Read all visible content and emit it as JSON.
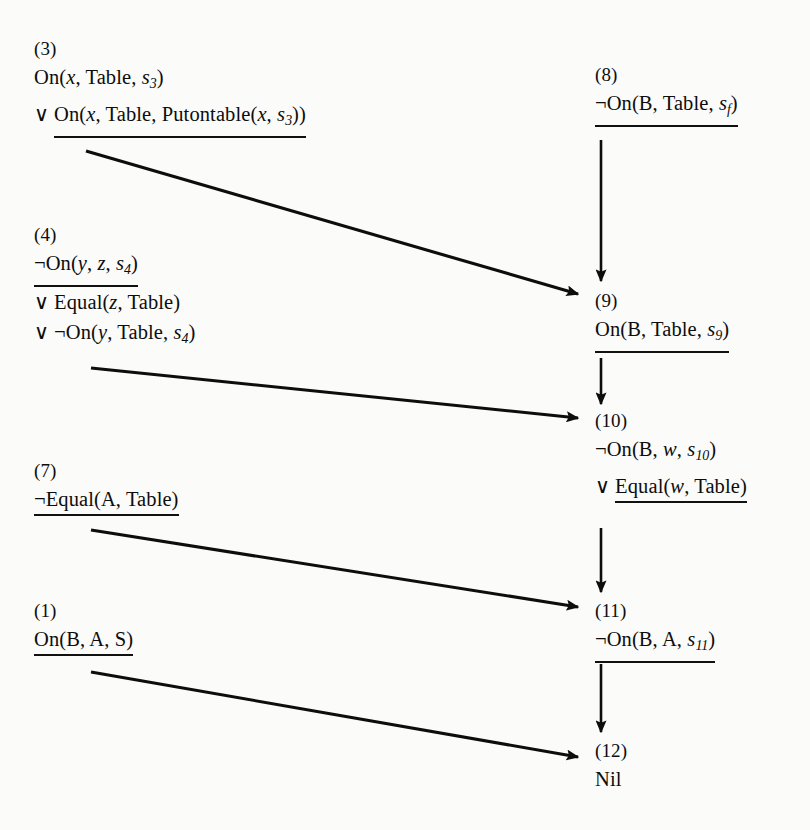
{
  "figure": {
    "type": "resolution-refutation-diagram",
    "ink_color": "#0d0d0d",
    "paper_color": "#fbfbf9"
  },
  "clauses": {
    "c3": {
      "tag": "(3)",
      "lines": [
        {
          "op": "",
          "text": "On(x, Table, s3)",
          "underlined": false
        },
        {
          "op": "∨",
          "text": "On(x, Table, Putontable(x, s3))",
          "underlined": true
        }
      ]
    },
    "c4": {
      "tag": "(4)",
      "lines": [
        {
          "op": "",
          "text": "¬On(y, z, s4)",
          "underlined": true
        },
        {
          "op": "∨",
          "text": "Equal(z, Table)",
          "underlined": false
        },
        {
          "op": "∨",
          "text": "¬On(y, Table, s4)",
          "underlined": false
        }
      ]
    },
    "c7": {
      "tag": "(7)",
      "lines": [
        {
          "op": "",
          "text": "¬Equal(A, Table)",
          "underlined": true
        }
      ]
    },
    "c1": {
      "tag": "(1)",
      "lines": [
        {
          "op": "",
          "text": "On(B, A, S)",
          "underlined": true
        }
      ]
    },
    "c8": {
      "tag": "(8)",
      "lines": [
        {
          "op": "",
          "text": "¬On(B, Table, sf)",
          "underlined": true
        }
      ]
    },
    "c9": {
      "tag": "(9)",
      "lines": [
        {
          "op": "",
          "text": "On(B, Table, s9)",
          "underlined": true
        }
      ]
    },
    "c10": {
      "tag": "(10)",
      "lines": [
        {
          "op": "",
          "text": "¬On(B, w, s10)",
          "underlined": false
        },
        {
          "op": "∨",
          "text": "Equal(w, Table)",
          "underlined": true
        }
      ]
    },
    "c11": {
      "tag": "(11)",
      "lines": [
        {
          "op": "",
          "text": "¬On(B, A, s11)",
          "underlined": true
        }
      ]
    },
    "c12": {
      "tag": "(12)",
      "lines": [
        {
          "op": "",
          "text": "Nil",
          "underlined": false
        }
      ]
    }
  },
  "edges": [
    {
      "name": "edge-8-to-9",
      "from": "c8",
      "to": "c9",
      "kind": "vertical"
    },
    {
      "name": "edge-3-to-9",
      "from": "c3",
      "to": "c9",
      "kind": "diagonal"
    },
    {
      "name": "edge-9-to-10",
      "from": "c9",
      "to": "c10",
      "kind": "vertical"
    },
    {
      "name": "edge-4-to-10",
      "from": "c4",
      "to": "c10",
      "kind": "diagonal"
    },
    {
      "name": "edge-10-to-11",
      "from": "c10",
      "to": "c11",
      "kind": "vertical"
    },
    {
      "name": "edge-7-to-11",
      "from": "c7",
      "to": "c11",
      "kind": "diagonal"
    },
    {
      "name": "edge-11-to-12",
      "from": "c11",
      "to": "c12",
      "kind": "vertical"
    },
    {
      "name": "edge-1-to-12",
      "from": "c1",
      "to": "c12",
      "kind": "diagonal"
    }
  ]
}
